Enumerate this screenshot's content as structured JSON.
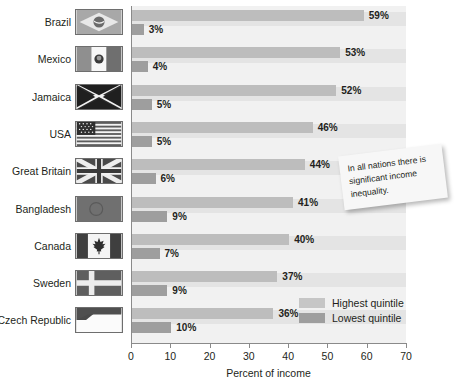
{
  "chart_data": {
    "type": "bar",
    "orientation": "horizontal",
    "title": "",
    "xlabel": "Percent of income",
    "ylabel": "",
    "xlim": [
      0,
      70
    ],
    "xticks": [
      0,
      10,
      20,
      30,
      40,
      50,
      60,
      70
    ],
    "grid": false,
    "legend_position": "inside-bottom-right",
    "categories": [
      "Brazil",
      "Mexico",
      "Jamaica",
      "USA",
      "Great Britain",
      "Bangladesh",
      "Canada",
      "Sweden",
      "Czech Republic"
    ],
    "series": [
      {
        "name": "Highest quintile",
        "color": "#bdbdbd",
        "values": [
          59,
          53,
          52,
          46,
          44,
          41,
          40,
          37,
          36
        ],
        "labels": [
          "59%",
          "53%",
          "52%",
          "46%",
          "44%",
          "41%",
          "40%",
          "37%",
          "36%"
        ]
      },
      {
        "name": "Lowest quintile",
        "color": "#9e9e9e",
        "values": [
          3,
          4,
          5,
          5,
          6,
          9,
          7,
          9,
          10
        ],
        "labels": [
          "3%",
          "4%",
          "5%",
          "5%",
          "6%",
          "9%",
          "7%",
          "9%",
          "10%"
        ]
      }
    ],
    "annotations": [
      {
        "text": "In all nations there is significant income inequality."
      }
    ]
  },
  "axis": {
    "xlabel": "Percent of income",
    "ticks": [
      "0",
      "10",
      "20",
      "30",
      "40",
      "50",
      "60",
      "70"
    ]
  },
  "legend": {
    "items": [
      {
        "label": "Highest quintile",
        "swatch": "high"
      },
      {
        "label": "Lowest quintile",
        "swatch": "low"
      }
    ]
  },
  "note": {
    "text": "In all nations there is significant income inequality."
  },
  "rows": [
    {
      "country": "Brazil",
      "flag": "flag-brazil",
      "high": "59%",
      "low": "3%"
    },
    {
      "country": "Mexico",
      "flag": "flag-mexico",
      "high": "53%",
      "low": "4%"
    },
    {
      "country": "Jamaica",
      "flag": "flag-jamaica",
      "high": "52%",
      "low": "5%"
    },
    {
      "country": "USA",
      "flag": "flag-usa",
      "high": "46%",
      "low": "5%"
    },
    {
      "country": "Great Britain",
      "flag": "flag-great-britain",
      "high": "44%",
      "low": "6%"
    },
    {
      "country": "Bangladesh",
      "flag": "flag-bangladesh",
      "high": "41%",
      "low": "9%"
    },
    {
      "country": "Canada",
      "flag": "flag-canada",
      "high": "40%",
      "low": "7%"
    },
    {
      "country": "Sweden",
      "flag": "flag-sweden",
      "high": "37%",
      "low": "9%"
    },
    {
      "country": "Czech Republic",
      "flag": "flag-czech-republic",
      "high": "36%",
      "low": "10%"
    }
  ]
}
